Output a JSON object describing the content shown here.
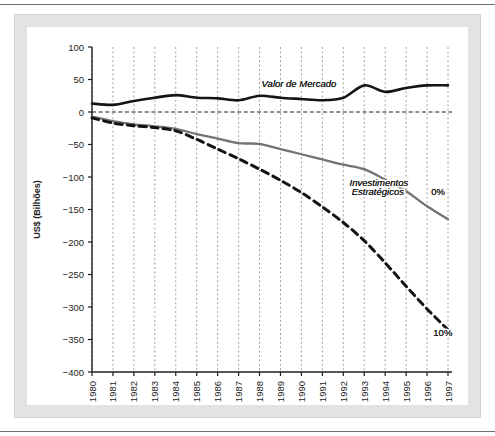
{
  "figure": {
    "frame_color": "#e3e3e3",
    "background": "#ffffff",
    "rule_color": "#6f6f6f"
  },
  "chart_data": {
    "type": "line",
    "title": "",
    "subtitle": "",
    "xlabel": "",
    "ylabel": "US$ (Bilhões)",
    "xlim": [
      1980,
      1997
    ],
    "ylim": [
      -400,
      100
    ],
    "yticks": [
      100,
      50,
      0,
      -50,
      -100,
      -150,
      -200,
      -250,
      -300,
      -350,
      -400
    ],
    "ytick_labels": [
      "100",
      "50",
      "0",
      "−50",
      "−100",
      "−150",
      "−200",
      "−250",
      "−300",
      "−350",
      "−400"
    ],
    "grid": "vertical-dashed",
    "zero_line": true,
    "legend": "inline-annotations",
    "categories": [
      1980,
      1981,
      1982,
      1983,
      1984,
      1985,
      1986,
      1987,
      1988,
      1989,
      1990,
      1991,
      1992,
      1993,
      1994,
      1995,
      1996,
      1997
    ],
    "xtick_labels": [
      "1980",
      "1981",
      "1982",
      "1983",
      "1984",
      "1985",
      "1986",
      "1987",
      "1988",
      "1989",
      "1990",
      "1991",
      "1992",
      "1993",
      "1994",
      "1995",
      "1996",
      "1997"
    ],
    "series": [
      {
        "name": "Valor de Mercado",
        "style": "solid",
        "color": "#141414",
        "width": 2.6,
        "values": [
          13,
          11,
          17,
          22,
          26,
          22,
          21,
          18,
          25,
          22,
          20,
          18,
          22,
          41,
          31,
          37,
          41,
          41
        ]
      },
      {
        "name": "Investimentos Estratégicos 0%",
        "style": "solid",
        "color": "#737373",
        "width": 2.3,
        "values": [
          -7,
          -14,
          -19,
          -22,
          -26,
          -34,
          -41,
          -48,
          -49,
          -57,
          -65,
          -73,
          -81,
          -88,
          -104,
          -122,
          -145,
          -165
        ]
      },
      {
        "name": "Investimentos Estratégicos 10%",
        "style": "dashed",
        "color": "#141414",
        "width": 3.0,
        "values": [
          -9,
          -17,
          -21,
          -24,
          -29,
          -42,
          -57,
          -72,
          -88,
          -105,
          -124,
          -146,
          -170,
          -198,
          -232,
          -268,
          -303,
          -335
        ]
      }
    ],
    "annotations": [
      {
        "text": "Valor de Mercado",
        "x": 1988.1,
        "y": 38,
        "style": "italic"
      },
      {
        "text": "Investimentos",
        "x": 1992.3,
        "y": -114,
        "style": "italic"
      },
      {
        "text": "Estratégicos",
        "x": 1992.4,
        "y": -128,
        "style": "italic"
      },
      {
        "text": "0%",
        "x": 1996.2,
        "y": -128,
        "style": "normal"
      },
      {
        "text": "10%",
        "x": 1996.3,
        "y": -345,
        "style": "normal"
      }
    ]
  }
}
